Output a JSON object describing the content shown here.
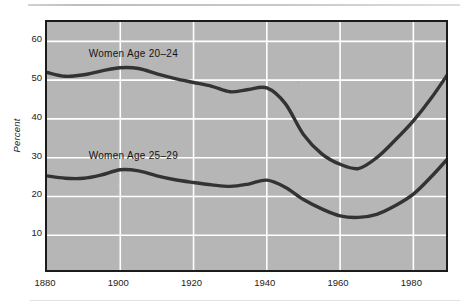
{
  "figure": {
    "background_color": "#ffffff",
    "plot_background_color": "#b6b6b6",
    "grid_color": "#ffffff",
    "line_color": "#333333",
    "axis_color": "#1b1b1b"
  },
  "axes": {
    "ylabel": "Percent",
    "y_ticks": [
      10,
      20,
      30,
      40,
      50,
      60
    ],
    "y_tick_labels": [
      "10",
      "20",
      "30",
      "40",
      "50",
      "60"
    ],
    "x_ticks": [
      1880,
      1900,
      1920,
      1940,
      1960,
      1980
    ],
    "x_tick_labels": [
      "1880",
      "1900",
      "1920",
      "1940",
      "1960",
      "1980"
    ]
  },
  "labels": {
    "series1": "Women Age 20–24",
    "series2": "Women Age 25–29"
  },
  "chart_data": {
    "type": "line",
    "title": "",
    "subtitle": "",
    "xlabel": "",
    "ylabel": "Percent",
    "xlim": [
      1880,
      1990
    ],
    "ylim": [
      0,
      65
    ],
    "grid": true,
    "legend": "inline-labels",
    "x": [
      1880,
      1885,
      1890,
      1895,
      1900,
      1905,
      1910,
      1915,
      1920,
      1925,
      1930,
      1935,
      1940,
      1945,
      1950,
      1955,
      1960,
      1965,
      1970,
      1975,
      1980,
      1985,
      1990
    ],
    "series": [
      {
        "name": "Women Age 20–24",
        "label_text": "Women Age 20–24",
        "values": [
          52.0,
          51.0,
          51.4,
          52.4,
          53.2,
          53.0,
          51.6,
          50.4,
          49.4,
          48.4,
          47.0,
          47.6,
          48.0,
          44.0,
          36.0,
          31.0,
          28.3,
          27.2,
          30.0,
          34.5,
          39.5,
          45.5,
          52.4
        ]
      },
      {
        "name": "Women Age 25–29",
        "label_text": "Women Age 25–29",
        "values": [
          25.3,
          24.7,
          24.7,
          25.6,
          26.9,
          26.6,
          25.3,
          24.3,
          23.6,
          23.0,
          22.6,
          23.2,
          24.2,
          22.4,
          19.2,
          16.8,
          15.0,
          14.6,
          15.4,
          17.6,
          20.6,
          25.2,
          30.4
        ]
      }
    ]
  }
}
